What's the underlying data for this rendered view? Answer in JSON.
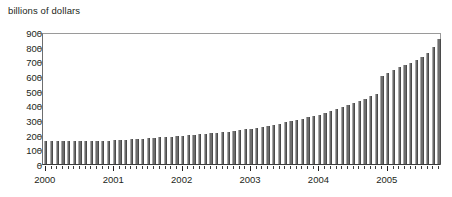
{
  "chart_data": {
    "type": "bar",
    "title": "billions of dollars",
    "xlabel": "",
    "ylabel": "billions of dollars",
    "ylim": [
      0,
      900
    ],
    "yticks": [
      0,
      100,
      200,
      300,
      400,
      500,
      600,
      700,
      800,
      900
    ],
    "ytick_labels": [
      "0",
      "100",
      "200",
      "300",
      "400",
      "500",
      "600",
      "700",
      "800",
      "900"
    ],
    "grid": false,
    "legend": "none",
    "bar_color": "#6d6d6d",
    "xtick_labels": [
      "2000",
      "2001",
      "2002",
      "2003",
      "2004",
      "2005"
    ],
    "x_major_positions": [
      0,
      12,
      24,
      36,
      48,
      60
    ],
    "categories": [
      "2000-01",
      "2000-02",
      "2000-03",
      "2000-04",
      "2000-05",
      "2000-06",
      "2000-07",
      "2000-08",
      "2000-09",
      "2000-10",
      "2000-11",
      "2000-12",
      "2001-01",
      "2001-02",
      "2001-03",
      "2001-04",
      "2001-05",
      "2001-06",
      "2001-07",
      "2001-08",
      "2001-09",
      "2001-10",
      "2001-11",
      "2001-12",
      "2002-01",
      "2002-02",
      "2002-03",
      "2002-04",
      "2002-05",
      "2002-06",
      "2002-07",
      "2002-08",
      "2002-09",
      "2002-10",
      "2002-11",
      "2002-12",
      "2003-01",
      "2003-02",
      "2003-03",
      "2003-04",
      "2003-05",
      "2003-06",
      "2003-07",
      "2003-08",
      "2003-09",
      "2003-10",
      "2003-11",
      "2003-12",
      "2004-01",
      "2004-02",
      "2004-03",
      "2004-04",
      "2004-05",
      "2004-06",
      "2004-07",
      "2004-08",
      "2004-09",
      "2004-10",
      "2004-11",
      "2004-12",
      "2005-01",
      "2005-02",
      "2005-03",
      "2005-04",
      "2005-05",
      "2005-06",
      "2005-07",
      "2005-08",
      "2005-09",
      "2005-10"
    ],
    "values": [
      158,
      155,
      155,
      156,
      155,
      156,
      156,
      157,
      157,
      158,
      158,
      160,
      162,
      163,
      165,
      168,
      170,
      172,
      176,
      180,
      182,
      184,
      186,
      188,
      192,
      196,
      198,
      202,
      206,
      210,
      213,
      216,
      220,
      224,
      230,
      236,
      242,
      248,
      254,
      262,
      268,
      276,
      284,
      292,
      300,
      310,
      318,
      326,
      336,
      348,
      360,
      372,
      386,
      400,
      414,
      430,
      446,
      462,
      476,
      600,
      620,
      640,
      660,
      676,
      690,
      706,
      730,
      760,
      800,
      850
    ]
  }
}
